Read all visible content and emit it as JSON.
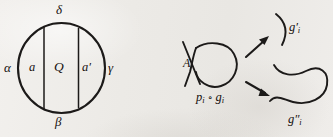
{
  "figure": {
    "kind": "mathematical-line-diagram",
    "background_color": "#eeece9",
    "ink_color": "#1c1a19"
  },
  "left_diagram": {
    "name": "circle-with-two-chords",
    "outer_labels": {
      "top": "δ",
      "bottom": "β",
      "left": "α",
      "right": "γ"
    },
    "inner_labels": {
      "left_region": "a",
      "middle_region": "Q",
      "right_region": "a′"
    }
  },
  "right_diagram": {
    "name": "crossing-resolution",
    "source": {
      "crossing_label": "A",
      "caption": "p",
      "caption_sub1": "i",
      "caption_op": "∘",
      "caption_base2": "g",
      "caption_sub2": "i",
      "caption_full": "pᵢ ∘ gᵢ"
    },
    "results": [
      {
        "position": "upper-right",
        "shape": "open-arc",
        "base": "g",
        "primes": "′",
        "sub": "i",
        "label_full": "g′ᵢ"
      },
      {
        "position": "lower-right",
        "shape": "s-curve-teardrop",
        "base": "g",
        "primes": "″",
        "sub": "i",
        "label_full": "g″ᵢ"
      }
    ],
    "arrows": [
      {
        "name": "arrow-to-upper-result",
        "direction": "up-right"
      },
      {
        "name": "arrow-to-lower-result",
        "direction": "down-right"
      }
    ]
  }
}
